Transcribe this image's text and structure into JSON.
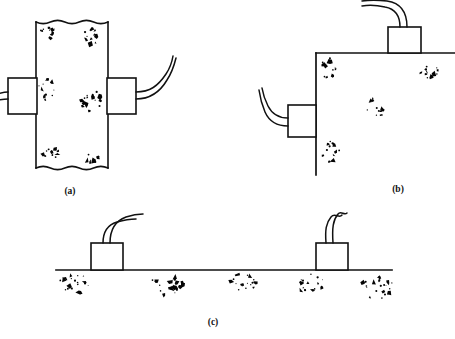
{
  "figure": {
    "background_color": "#ffffff",
    "ink_color": "#111111",
    "aggregate_color": "#050505",
    "width": 455,
    "height": 339
  },
  "panels": [
    {
      "id": "a",
      "label": "(a)",
      "label_x": 70,
      "label_y": 194,
      "arrangement": "direct-transmission",
      "member": {
        "name": "concrete-wall-section",
        "kind": "wall-vertical",
        "x": 36,
        "y": 22,
        "width": 72,
        "height": 146,
        "top_edge": "wavy-break",
        "bottom_edge": "wavy-break",
        "left_edge": "straight",
        "right_edge": "straight",
        "wave_amplitude": 3.2,
        "wave_count": 5
      },
      "transducers": [
        {
          "name": "transducer-left",
          "x": 8,
          "y": 78,
          "width": 29,
          "height": 36,
          "mount_face": "left",
          "cable": {
            "name": "cable-left",
            "exit": "left",
            "path": "M 8,92 C 2,92 -2,94 -8,96",
            "path2": "M 8,99 C 2,99 -2,100 -8,101",
            "strands": 2
          }
        },
        {
          "name": "transducer-right",
          "x": 107,
          "y": 78,
          "width": 29,
          "height": 36,
          "mount_face": "right",
          "cable": {
            "name": "cable-right",
            "exit": "right",
            "path": "M 136,92 C 150,92 158,86 166,74 C 170,68 172,62 173,56",
            "path2": "M 136,99 C 151,99 160,92 167,80 C 171,74 174,66 176,58",
            "strands": 2
          }
        }
      ],
      "aggregate_clusters": [
        {
          "cx": 48,
          "cy": 34,
          "rx": 9,
          "ry": 8,
          "count": 11,
          "seed": 11
        },
        {
          "cx": 90,
          "cy": 36,
          "rx": 10,
          "ry": 9,
          "count": 12,
          "seed": 23
        },
        {
          "cx": 47,
          "cy": 90,
          "rx": 9,
          "ry": 11,
          "count": 13,
          "seed": 37
        },
        {
          "cx": 91,
          "cy": 101,
          "rx": 11,
          "ry": 12,
          "count": 15,
          "seed": 51
        },
        {
          "cx": 50,
          "cy": 155,
          "rx": 10,
          "ry": 9,
          "count": 12,
          "seed": 67
        },
        {
          "cx": 93,
          "cy": 158,
          "rx": 8,
          "ry": 7,
          "count": 9,
          "seed": 83
        }
      ]
    },
    {
      "id": "b",
      "label": "(b)",
      "label_x": 398,
      "label_y": 192,
      "arrangement": "semi-direct-transmission",
      "member": {
        "name": "concrete-corner-section",
        "kind": "corner",
        "corner_x": 316,
        "corner_y": 53,
        "top_surface_x2": 455,
        "bottom_surface_y2": 175
      },
      "transducers": [
        {
          "name": "transducer-top",
          "x": 388,
          "y": 27,
          "width": 33,
          "height": 26,
          "mount_face": "top",
          "cable": {
            "name": "cable-top",
            "exit": "top",
            "path": "M 400,27 C 400,16 396,9 385,7 C 376,5 368,5 362,6",
            "path2": "M 407,27 C 407,13 401,3 387,1 C 378,0 369,0 362,1",
            "strands": 2
          }
        },
        {
          "name": "transducer-side",
          "x": 288,
          "y": 105,
          "width": 28,
          "height": 32,
          "mount_face": "left",
          "cable": {
            "name": "cable-side",
            "exit": "left",
            "path": "M 288,118 C 278,118 272,114 268,106 C 265,100 263,94 262,88",
            "path2": "M 288,126 C 276,126 269,121 265,112 C 262,105 260,97 259,90",
            "strands": 2
          }
        }
      ],
      "aggregate_clusters": [
        {
          "cx": 329,
          "cy": 68,
          "rx": 9,
          "ry": 10,
          "count": 13,
          "seed": 101
        },
        {
          "cx": 428,
          "cy": 70,
          "rx": 11,
          "ry": 9,
          "count": 13,
          "seed": 113
        },
        {
          "cx": 375,
          "cy": 108,
          "rx": 10,
          "ry": 11,
          "count": 14,
          "seed": 131
        },
        {
          "cx": 330,
          "cy": 152,
          "rx": 10,
          "ry": 11,
          "count": 14,
          "seed": 149
        }
      ]
    },
    {
      "id": "c",
      "label": "(c)",
      "label_x": 213,
      "label_y": 325,
      "arrangement": "indirect-surface-transmission",
      "member": {
        "name": "concrete-slab-surface",
        "kind": "slab-horizontal",
        "surface_y": 270,
        "surface_x1": 56,
        "surface_x2": 392
      },
      "transducers": [
        {
          "name": "transducer-left",
          "x": 91,
          "y": 243,
          "width": 32,
          "height": 27,
          "mount_face": "top",
          "cable": {
            "name": "cable-left",
            "exit": "top",
            "path": "M 103,243 C 103,232 107,225 117,222 C 124,220 130,219 136,219",
            "path2": "M 110,243 C 110,229 115,221 126,217 C 132,215 138,214 143,214",
            "strands": 2
          }
        },
        {
          "name": "transducer-right",
          "x": 316,
          "y": 243,
          "width": 32,
          "height": 27,
          "mount_face": "top",
          "cable": {
            "name": "cable-right",
            "exit": "top",
            "path": "M 326,243 C 325,230 326,223 331,217 C 335,212 339,219 342,215",
            "path2": "M 333,243 C 332,228 333,220 338,214 C 341,210 344,216 347,213",
            "strands": 2
          }
        }
      ],
      "aggregate_clusters": [
        {
          "cx": 75,
          "cy": 285,
          "rx": 17,
          "ry": 11,
          "count": 20,
          "seed": 167
        },
        {
          "cx": 168,
          "cy": 284,
          "rx": 17,
          "ry": 11,
          "count": 20,
          "seed": 181
        },
        {
          "cx": 243,
          "cy": 283,
          "rx": 14,
          "ry": 10,
          "count": 16,
          "seed": 199
        },
        {
          "cx": 310,
          "cy": 283,
          "rx": 15,
          "ry": 10,
          "count": 17,
          "seed": 211
        },
        {
          "cx": 378,
          "cy": 288,
          "rx": 17,
          "ry": 12,
          "count": 21,
          "seed": 223
        }
      ]
    }
  ]
}
